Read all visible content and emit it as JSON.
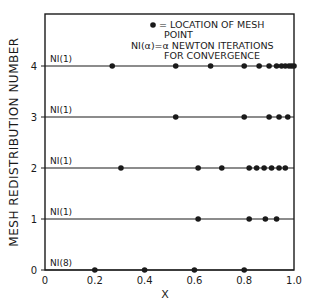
{
  "chart_data": {
    "type": "scatter",
    "title": "",
    "xlabel": "X",
    "ylabel": "MESH REDISTRIBUTION NUMBER",
    "xlim": [
      0,
      1.0
    ],
    "ylim": [
      0,
      4
    ],
    "grid": false,
    "x_ticks": [
      "0",
      "0.2",
      "0.4",
      "0.6",
      "0.8",
      "1.0"
    ],
    "y_ticks": [
      "0",
      "1",
      "2",
      "3",
      "4"
    ],
    "legend": {
      "position": "top-right-inside",
      "lines": [
        "• = LOCATION OF MESH",
        "POINT",
        "NI(α)=α NEWTON ITERATIONS",
        "FOR CONVERGENCE"
      ]
    },
    "series": [
      {
        "name": "mesh 0",
        "y": 0,
        "annotation": "NI(8)",
        "x": [
          0.2,
          0.4,
          0.6,
          0.8
        ]
      },
      {
        "name": "mesh 1",
        "y": 1,
        "annotation": "NI(1)",
        "x": [
          0.615,
          0.82,
          0.885,
          0.93
        ]
      },
      {
        "name": "mesh 2",
        "y": 2,
        "annotation": "NI(1)",
        "x": [
          0.305,
          0.615,
          0.71,
          0.82,
          0.85,
          0.88,
          0.91,
          0.94,
          0.965
        ]
      },
      {
        "name": "mesh 3",
        "y": 3,
        "annotation": "NI(1)",
        "x": [
          0.525,
          0.8,
          0.9,
          0.94,
          0.975
        ]
      },
      {
        "name": "mesh 4",
        "y": 4,
        "annotation": "NI(1)",
        "x": [
          0.27,
          0.525,
          0.665,
          0.8,
          0.86,
          0.9,
          0.93,
          0.95,
          0.965,
          0.98,
          0.99,
          1.0
        ]
      }
    ]
  },
  "labels": {
    "xlabel": "X",
    "ylabel": "MESH REDISTRIBUTION NUMBER",
    "legend_line1": "= LOCATION OF MESH",
    "legend_line2": "POINT",
    "legend_line3": "NI(α)=α NEWTON ITERATIONS",
    "legend_line4": "FOR CONVERGENCE"
  },
  "colors": {
    "ink": "#1a1a1a",
    "background": "#ffffff"
  }
}
